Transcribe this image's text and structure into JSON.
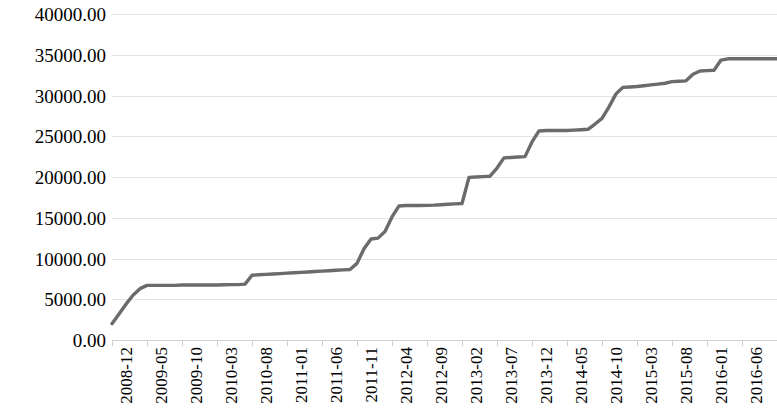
{
  "chart_data": {
    "type": "line",
    "title": "",
    "subtitle": "",
    "xlabel": "",
    "ylabel": "",
    "grid": true,
    "legend": false,
    "legend_position": "none",
    "line_color": "#6b6b6b",
    "background_color": "#ffffff",
    "gridline_color": "#e4e4e4",
    "ylim": [
      0,
      40000
    ],
    "y_ticks": [
      0,
      5000,
      10000,
      15000,
      20000,
      25000,
      30000,
      35000,
      40000
    ],
    "y_tick_labels": [
      "0.00",
      "5000.00",
      "10000.00",
      "15000.00",
      "20000.00",
      "25000.00",
      "30000.00",
      "35000.00",
      "40000.00"
    ],
    "x_tick_labels": [
      "2008-12",
      "2009-05",
      "2009-10",
      "2010-03",
      "2010-08",
      "2011-01",
      "2011-06",
      "2011-11",
      "2012-04",
      "2012-09",
      "2013-02",
      "2013-07",
      "2013-12",
      "2014-05",
      "2014-10",
      "2015-03",
      "2015-08",
      "2016-01",
      "2016-06",
      "2016-11"
    ],
    "x_tick_interval_months": 5,
    "x": [
      "2008-12",
      "2009-01",
      "2009-02",
      "2009-03",
      "2009-04",
      "2009-05",
      "2009-06",
      "2009-07",
      "2009-08",
      "2009-09",
      "2009-10",
      "2009-11",
      "2009-12",
      "2010-01",
      "2010-02",
      "2010-03",
      "2010-04",
      "2010-05",
      "2010-06",
      "2010-07",
      "2010-08",
      "2010-09",
      "2010-10",
      "2010-11",
      "2010-12",
      "2011-01",
      "2011-02",
      "2011-03",
      "2011-04",
      "2011-05",
      "2011-06",
      "2011-07",
      "2011-08",
      "2011-09",
      "2011-10",
      "2011-11",
      "2011-12",
      "2012-01",
      "2012-02",
      "2012-03",
      "2012-04",
      "2012-05",
      "2012-06",
      "2012-07",
      "2012-08",
      "2012-09",
      "2012-10",
      "2012-11",
      "2012-12",
      "2013-01",
      "2013-02",
      "2013-03",
      "2013-04",
      "2013-05",
      "2013-06",
      "2013-07",
      "2013-08",
      "2013-09",
      "2013-10",
      "2013-11",
      "2013-12",
      "2014-01",
      "2014-02",
      "2014-03",
      "2014-04",
      "2014-05",
      "2014-06",
      "2014-07",
      "2014-08",
      "2014-09",
      "2014-10",
      "2014-11",
      "2014-12",
      "2015-01",
      "2015-02",
      "2015-03",
      "2015-04",
      "2015-05",
      "2015-06",
      "2015-07",
      "2015-08",
      "2015-09",
      "2015-10",
      "2015-11",
      "2015-12",
      "2016-01",
      "2016-02",
      "2016-03",
      "2016-04",
      "2016-05",
      "2016-06",
      "2016-07",
      "2016-08",
      "2016-09",
      "2016-10",
      "2016-11"
    ],
    "values": [
      2000,
      3200,
      4400,
      5500,
      6300,
      6700,
      6700,
      6700,
      6700,
      6700,
      6750,
      6750,
      6750,
      6750,
      6750,
      6750,
      6780,
      6800,
      6800,
      6850,
      7950,
      8000,
      8050,
      8100,
      8150,
      8200,
      8250,
      8300,
      8350,
      8400,
      8450,
      8500,
      8550,
      8600,
      8650,
      9400,
      11200,
      12400,
      12500,
      13300,
      15100,
      16450,
      16500,
      16500,
      16500,
      16520,
      16550,
      16600,
      16650,
      16700,
      16750,
      19950,
      20000,
      20050,
      20100,
      21100,
      22350,
      22400,
      22450,
      22500,
      24300,
      25650,
      25700,
      25700,
      25700,
      25700,
      25750,
      25800,
      25850,
      26500,
      27200,
      28600,
      30200,
      31000,
      31050,
      31100,
      31200,
      31300,
      31400,
      31500,
      31700,
      31750,
      31800,
      32600,
      33000,
      33050,
      33100,
      34350,
      34500,
      34500,
      34500,
      34500,
      34500,
      34500,
      34500,
      34500
    ]
  }
}
